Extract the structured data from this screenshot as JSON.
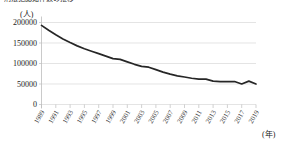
{
  "chart_data": {
    "type": "line",
    "title": "刑法犯認知件数の推移",
    "ylabel_unit": "(人)",
    "xlabel_unit": "(年)",
    "xlabel": "",
    "ylabel": "",
    "grid": true,
    "legend": false,
    "ylim": [
      0,
      200000
    ],
    "ytick_labels": [
      "0",
      "50000",
      "100000",
      "150000",
      "200000"
    ],
    "ytick_values": [
      0,
      50000,
      100000,
      150000,
      200000
    ],
    "xlim": [
      1989,
      2019
    ],
    "xtick_labels": [
      "1989",
      "1991",
      "1993",
      "1995",
      "1997",
      "1999",
      "2001",
      "2003",
      "2005",
      "2007",
      "2009",
      "2011",
      "2013",
      "2015",
      "2017",
      "2019"
    ],
    "xtick_values": [
      1989,
      1991,
      1993,
      1995,
      1997,
      1999,
      2001,
      2003,
      2005,
      2007,
      2009,
      2011,
      2013,
      2015,
      2017,
      2019
    ],
    "series": [
      {
        "name": "人数",
        "color": "#262626",
        "x": [
          1989,
          1990,
          1991,
          1992,
          1993,
          1994,
          1995,
          1996,
          1997,
          1998,
          1999,
          2000,
          2001,
          2002,
          2003,
          2004,
          2005,
          2006,
          2007,
          2008,
          2009,
          2010,
          2011,
          2012,
          2013,
          2014,
          2015,
          2016,
          2017,
          2018,
          2019
        ],
        "values": [
          193000,
          181000,
          170000,
          160000,
          151000,
          143000,
          136000,
          130000,
          124000,
          118000,
          112000,
          110000,
          104000,
          98000,
          93000,
          91000,
          85000,
          79000,
          74000,
          70000,
          67000,
          64000,
          62000,
          62000,
          57000,
          56000,
          56000,
          56000,
          50000,
          57000,
          50000
        ]
      }
    ]
  }
}
